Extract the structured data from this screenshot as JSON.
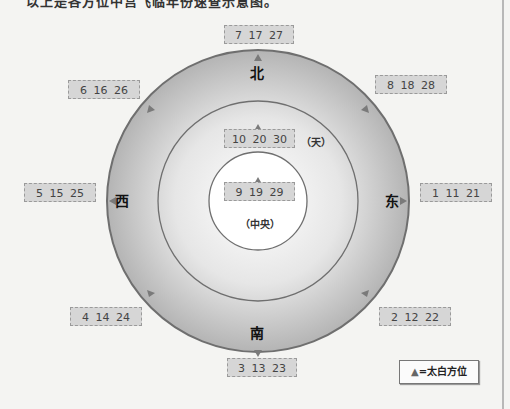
{
  "top_text": "以上是各方位中宫飞临年份速查示意图。",
  "directions": {
    "north": "北",
    "south": "南",
    "east": "东",
    "west": "西"
  },
  "labels": {
    "heaven": "（天）",
    "center": "（中央）"
  },
  "boxes": {
    "north": "7 17 27",
    "northeast": "8 18 28",
    "east": "1 11 21",
    "southeast": "2 12 22",
    "south": "3 13 23",
    "southwest": "4 14 24",
    "west": "5 15 25",
    "northwest": "6 16 26",
    "heaven": "10 20 30",
    "center": "9 19 29"
  },
  "legend": {
    "symbol": "▲",
    "text": "=太白方位"
  },
  "colors": {
    "outer_ring": "#bdbdbd",
    "ring_stroke": "#6f6f6f",
    "box_fill": "#d6d6d6",
    "marker": "#7a7a7a"
  }
}
